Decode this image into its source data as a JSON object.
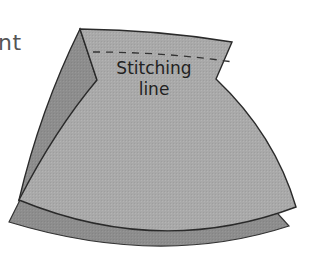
{
  "diagram": {
    "partial_label": "nt",
    "stitch_label_line1": "Stitching",
    "stitch_label_line2": "line",
    "colors": {
      "front_fabric": "#a8a8a8",
      "back_fabric": "#8c8c8c",
      "fold_fabric": "#8a8a8a",
      "outline": "#2a2a2a",
      "dashed_line": "#333333",
      "background": "#ffffff"
    }
  }
}
